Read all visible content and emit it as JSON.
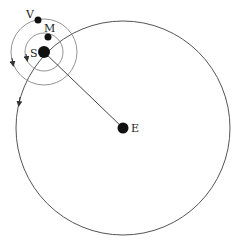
{
  "diagram": {
    "bodies": [
      {
        "id": "S",
        "label": "S",
        "name": "sun"
      },
      {
        "id": "M",
        "label": "M",
        "name": "mercury"
      },
      {
        "id": "V",
        "label": "V",
        "name": "venus"
      },
      {
        "id": "E",
        "label": "E",
        "name": "earth"
      }
    ],
    "colors": {
      "line": "#555555",
      "body": "#111111"
    }
  }
}
